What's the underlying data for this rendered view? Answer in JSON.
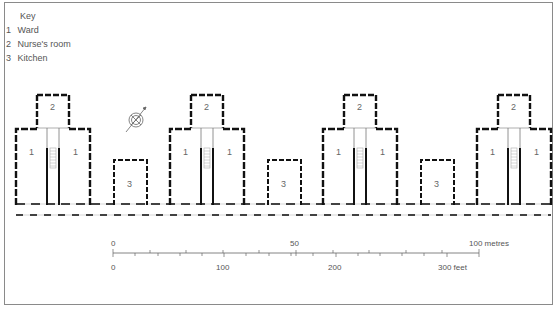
{
  "key": {
    "title": "Key",
    "items": [
      {
        "num": "1",
        "label": "Ward"
      },
      {
        "num": "2",
        "label": "Nurse's room"
      },
      {
        "num": "3",
        "label": "Kitchen"
      }
    ]
  },
  "plan": {
    "pavilions": [
      {
        "ward_label": "1",
        "nurse_label": "2"
      },
      {
        "ward_label": "1",
        "nurse_label": "2"
      },
      {
        "ward_label": "1",
        "nurse_label": "2"
      },
      {
        "ward_label": "1",
        "nurse_label": "2"
      }
    ],
    "kitchens": [
      {
        "label": "3"
      },
      {
        "label": "3"
      },
      {
        "label": "3"
      }
    ],
    "compass": "north-arrow-compass"
  },
  "scale": {
    "metres": {
      "labels": [
        "0",
        "50",
        "100 metres"
      ]
    },
    "feet": {
      "labels": [
        "0",
        "100",
        "200",
        "300 feet"
      ]
    }
  },
  "colors": {
    "wall": "#111111",
    "frame": "#8a8a8a",
    "text": "#555555"
  }
}
